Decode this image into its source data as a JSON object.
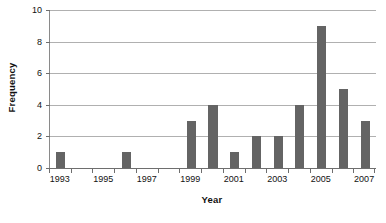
{
  "chart_data": {
    "type": "bar",
    "title": "",
    "xlabel": "Year",
    "ylabel": "Frequency",
    "categories": [
      "1993",
      "1994",
      "1995",
      "1996",
      "1997",
      "1998",
      "1999",
      "2000",
      "2001",
      "2002",
      "2003",
      "2004",
      "2005",
      "2006",
      "2007"
    ],
    "values": [
      1,
      0,
      0,
      1,
      0,
      0,
      3,
      4,
      1,
      2,
      2,
      4,
      9,
      5,
      3
    ],
    "series": [
      {
        "name": "Frequency",
        "values": [
          1,
          0,
          0,
          1,
          0,
          0,
          3,
          4,
          1,
          2,
          2,
          4,
          9,
          5,
          3
        ]
      }
    ],
    "ylim": [
      0,
      10
    ],
    "y_ticks": [
      0,
      2,
      4,
      6,
      8,
      10
    ],
    "y_tick_labels": [
      "0",
      "2",
      "4",
      "6",
      "8",
      "10"
    ],
    "x_tick_labels": [
      "1993",
      "1995",
      "1997",
      "1999",
      "2001",
      "2003",
      "2005",
      "2007"
    ],
    "x_tick_categories": [
      "1993",
      "1995",
      "1997",
      "1999",
      "2001",
      "2003",
      "2005",
      "2007"
    ],
    "grid": true,
    "grid_axis": "y",
    "legend": false,
    "legend_position": "none",
    "bar_color": "#646464",
    "grid_color": "#b0b0b0",
    "axis_color": "#6e6e6e",
    "text_color": "#111111",
    "background_color": "#ffffff",
    "bar_width_ratio": 0.42,
    "annotations": []
  }
}
